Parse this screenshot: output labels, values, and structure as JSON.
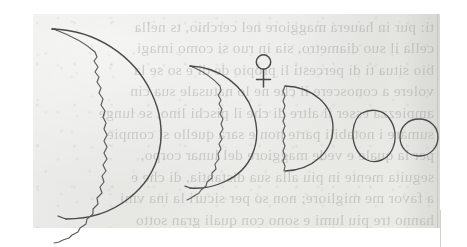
{
  "document": {
    "type": "historical-printed-page-figure",
    "title": "Phases of Venus diagram",
    "media": "aged paper with printed text showing through from the reverse side",
    "paper_color": "#e8e8e5",
    "ink_color": "#4a4a4a",
    "page_background": "#ffffff"
  },
  "symbol": {
    "name": "venus-symbol",
    "glyph": "♀",
    "label": "Venus"
  },
  "figure": {
    "caption": "Five drawn phases of Venus, decreasing in apparent size from a large thin crescent at the left to a small full disc at the right.",
    "phase_count": 5,
    "phases": [
      {
        "index": 1,
        "name": "large-thin-crescent",
        "phase": "thin crescent",
        "illumination_percent": 12,
        "apparent_diameter_px": 150,
        "terminator": "jagged",
        "note": "largest disc, nearest to Earth"
      },
      {
        "index": 2,
        "name": "medium-crescent",
        "phase": "crescent",
        "illumination_percent": 28,
        "apparent_diameter_px": 108,
        "terminator": "jagged",
        "note": "second phase"
      },
      {
        "index": 3,
        "name": "half-disc",
        "phase": "dichotomy / half",
        "illumination_percent": 50,
        "apparent_diameter_px": 84,
        "terminator": "straight, slightly jagged",
        "note": "quadrature"
      },
      {
        "index": 4,
        "name": "gibbous-disc",
        "phase": "gibbous",
        "illumination_percent": 88,
        "apparent_diameter_px": 52,
        "terminator": "none drawn",
        "note": "nearly full, irregular outline"
      },
      {
        "index": 5,
        "name": "full-disc",
        "phase": "full",
        "illumination_percent": 100,
        "apparent_diameter_px": 44,
        "terminator": "none",
        "note": "smallest disc, farthest from Earth"
      }
    ]
  },
  "show_through_text": {
    "description": "faint mirrored text printed on the reverse of the leaf",
    "lines": [
      "ti: pur in hauera maggiore nel cerchio, ts nella",
      "cella il suo diametro, sia in ruo si como imagi",
      "bio situa ti di percesti li propio de di e so se la",
      "volere a conoscere il che ne lo natusale sua cin",
      "ampiezza esser il altre di che il pischi lino, se lunge",
      "sumare i notabili parte non e sara quello si compie",
      "per la quale e vede maggiore del lunar corpo,",
      "seguita mente in piu alla sua distantia, di che e",
      "a favor me migliore; non so per sicuri la ina vmi",
      "hanno tre piu lumi e sono con quali gran sotto"
    ]
  }
}
